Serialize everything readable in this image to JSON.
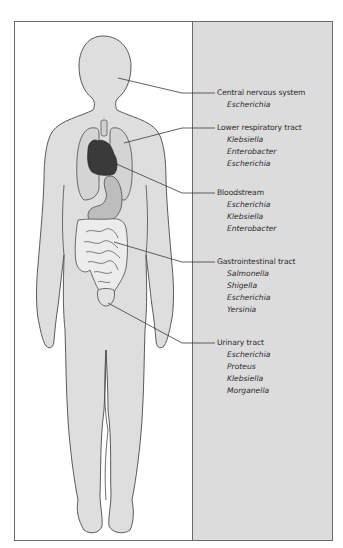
{
  "figure": {
    "colors": {
      "body_fill": "#dedede",
      "panel_fill": "#dcdcdc",
      "heart_fill": "#3a3a3a",
      "stomach_fill": "#bdbdbd",
      "outline": "#4a4a4a"
    }
  },
  "sites": [
    {
      "name": "Central nervous system",
      "organisms": [
        "Escherichia"
      ]
    },
    {
      "name": "Lower respiratory tract",
      "organisms": [
        "Klebsiella",
        "Enterobacter",
        "Escherichia"
      ]
    },
    {
      "name": "Bloodstream",
      "organisms": [
        "Escherichia",
        "Klebsiella",
        "Enterobacter"
      ]
    },
    {
      "name": "Gastrointestinal tract",
      "organisms": [
        "Salmonella",
        "Shigella",
        "Escherichia",
        "Yersinia"
      ]
    },
    {
      "name": "Urinary tract",
      "organisms": [
        "Escherichia",
        "Proteus",
        "Klebsiella",
        "Morganella"
      ]
    }
  ]
}
